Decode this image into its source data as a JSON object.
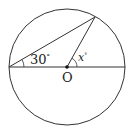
{
  "diagram": {
    "type": "circle-geometry",
    "colors": {
      "stroke": "#333333",
      "background": "#ffffff"
    },
    "circle": {
      "cx": 67,
      "cy": 67,
      "r": 58
    },
    "points": {
      "center": {
        "label": "O",
        "x": 67,
        "y": 67
      },
      "left": {
        "x": 9,
        "y": 67
      },
      "right": {
        "x": 125,
        "y": 67
      },
      "top": {
        "x": 95,
        "y": 17
      }
    },
    "angles": [
      {
        "label": "30°",
        "vertex": "left"
      },
      {
        "label": "x°",
        "vertex": "center"
      }
    ],
    "labels": {
      "center_label": "O",
      "angle_left": "30",
      "angle_left_unit": "°",
      "angle_center": "x",
      "angle_center_unit": "°"
    }
  }
}
